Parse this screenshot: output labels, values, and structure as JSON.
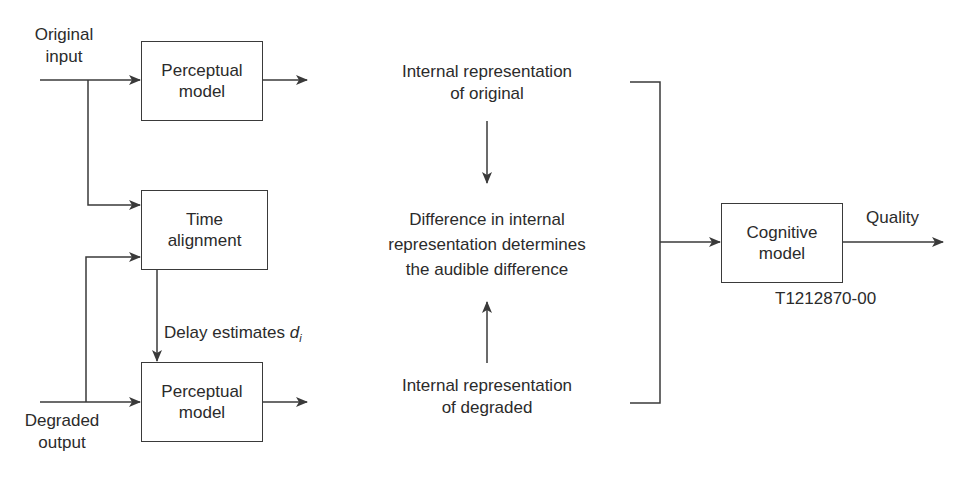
{
  "diagram": {
    "inputs": {
      "original": [
        "Original",
        "input"
      ],
      "degraded": [
        "Degraded",
        "output"
      ]
    },
    "blocks": {
      "perceptual_top": [
        "Perceptual",
        "model"
      ],
      "time_alignment": [
        "Time",
        "alignment"
      ],
      "perceptual_bottom": [
        "Perceptual",
        "model"
      ],
      "cognitive": [
        "Cognitive",
        "model"
      ]
    },
    "delay": {
      "text": "Delay estimates ",
      "var": "d",
      "sub": "i"
    },
    "internal": {
      "original": [
        "Internal representation",
        "of original"
      ],
      "difference": [
        "Difference in internal",
        "representation determines",
        "the audible difference"
      ],
      "degraded": [
        "Internal representation",
        "of degraded"
      ]
    },
    "output": {
      "quality": "Quality"
    },
    "figure_id": "T1212870-00",
    "colors": {
      "line": "#3a3a3a",
      "text": "#2b2b2b",
      "background": "#ffffff"
    }
  }
}
